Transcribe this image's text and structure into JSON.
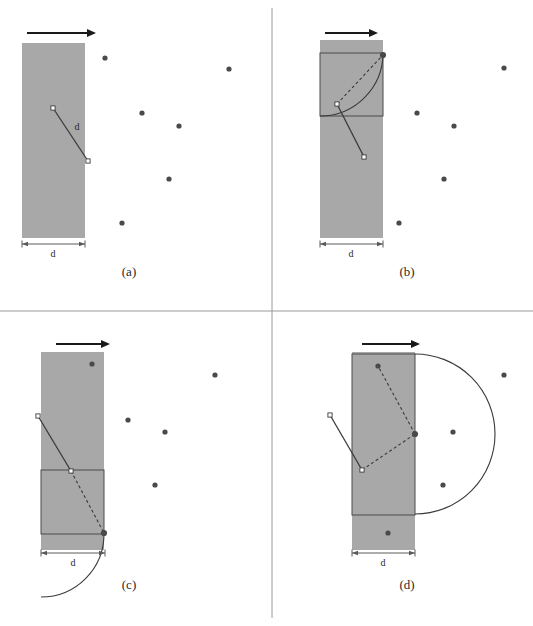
{
  "figure": {
    "width": 533,
    "height": 626,
    "background": "#ffffff",
    "divider_color": "#9a9a9a",
    "strip_fill": "#a8a8a8",
    "strip_stroke": "#6f6f6f",
    "square_stroke": "#4a4a4a",
    "dot_color": "#4a4a4a",
    "arrow_color": "#1a1a1a",
    "line_color": "#3a3a3a",
    "dash_color": "#3a3a3a",
    "open_marker_fill": "#ffffff",
    "dimension_color": "#5a5a5a",
    "dimension_label": "d",
    "segment_label": "d"
  },
  "dividers": {
    "vertical_x": 272,
    "horizontal_y": 311,
    "bottom_rule_y": 310
  },
  "panels": [
    {
      "id": "a",
      "caption": "(a)",
      "caption_x": 129,
      "caption_y": 276,
      "arrow": {
        "x1": 27,
        "y1": 33,
        "x2": 96,
        "y2": 33
      },
      "strip": {
        "x": 22,
        "y": 43,
        "w": 63,
        "h": 195
      },
      "dimension": {
        "x1": 22,
        "x2": 85,
        "y": 244,
        "label": "d",
        "label_x": 53,
        "label_y": 257
      },
      "square": null,
      "arc": null,
      "solid_segment": {
        "x1": 53,
        "y1": 108,
        "x2": 88,
        "y2": 161
      },
      "segment_label": {
        "text": "d",
        "x": 77,
        "y": 130
      },
      "dashed_segment": null,
      "open_markers": [
        {
          "x": 53,
          "y": 108
        },
        {
          "x": 88,
          "y": 161
        }
      ],
      "filled_endpoint": null,
      "dots": [
        {
          "x": 105,
          "y": 58
        },
        {
          "x": 229,
          "y": 69
        },
        {
          "x": 142,
          "y": 113
        },
        {
          "x": 179,
          "y": 126
        },
        {
          "x": 169,
          "y": 179
        },
        {
          "x": 122,
          "y": 223
        }
      ]
    },
    {
      "id": "b",
      "caption": "(b)",
      "caption_x": 407,
      "caption_y": 276,
      "arrow": {
        "x1": 325,
        "y1": 33,
        "x2": 378,
        "y2": 33
      },
      "strip": {
        "x": 320,
        "y": 40,
        "w": 63,
        "h": 198
      },
      "dimension": {
        "x1": 320,
        "x2": 383,
        "y": 244,
        "label": "d",
        "label_x": 351,
        "label_y": 257
      },
      "square": {
        "x": 320,
        "y": 53,
        "w": 63,
        "h": 63
      },
      "arc": {
        "cx": 320,
        "cy": 53,
        "r": 63,
        "start_angle": 0,
        "end_angle": 90
      },
      "solid_segment": {
        "x1": 337,
        "y1": 104,
        "x2": 364,
        "y2": 157
      },
      "segment_label": null,
      "dashed_segment": {
        "x1": 337,
        "y1": 104,
        "x2": 383,
        "y2": 55
      },
      "open_markers": [
        {
          "x": 337,
          "y": 104
        },
        {
          "x": 364,
          "y": 157
        }
      ],
      "filled_endpoint": {
        "x": 383,
        "y": 55
      },
      "dots": [
        {
          "x": 504,
          "y": 68
        },
        {
          "x": 417,
          "y": 113
        },
        {
          "x": 454,
          "y": 126
        },
        {
          "x": 444,
          "y": 179
        },
        {
          "x": 399,
          "y": 223
        }
      ]
    },
    {
      "id": "c",
      "caption": "(c)",
      "caption_x": 129,
      "caption_y": 589,
      "arrow": {
        "x1": 56,
        "y1": 344,
        "x2": 110,
        "y2": 344
      },
      "strip": {
        "x": 41,
        "y": 352,
        "w": 63,
        "h": 198
      },
      "dimension": {
        "x1": 41,
        "x2": 105,
        "y": 553,
        "label": "d",
        "label_x": 73,
        "label_y": 566
      },
      "square": {
        "x": 41,
        "y": 470,
        "w": 63,
        "h": 64
      },
      "arc": {
        "cx": 41,
        "cy": 534,
        "r": 63,
        "start_angle": 0,
        "end_angle": 90
      },
      "solid_segment": {
        "x1": 38,
        "y1": 416,
        "x2": 71,
        "y2": 471
      },
      "segment_label": null,
      "dashed_segment": {
        "x1": 71,
        "y1": 471,
        "x2": 104,
        "y2": 533
      },
      "open_markers": [
        {
          "x": 38,
          "y": 416
        },
        {
          "x": 71,
          "y": 471
        }
      ],
      "filled_endpoint": {
        "x": 104,
        "y": 533
      },
      "dots": [
        {
          "x": 92,
          "y": 364
        },
        {
          "x": 215,
          "y": 375
        },
        {
          "x": 128,
          "y": 420
        },
        {
          "x": 165,
          "y": 432
        },
        {
          "x": 155,
          "y": 485
        }
      ]
    },
    {
      "id": "d",
      "caption": "(d)",
      "caption_x": 407,
      "caption_y": 589,
      "arrow": {
        "x1": 362,
        "y1": 344,
        "x2": 420,
        "y2": 344
      },
      "strip": {
        "x": 352,
        "y": 352,
        "w": 63,
        "h": 198
      },
      "dimension": {
        "x1": 352,
        "x2": 415,
        "y": 553,
        "label": "d",
        "label_x": 383,
        "label_y": 566
      },
      "square": {
        "x": 352,
        "y": 354,
        "w": 63,
        "h": 161
      },
      "arc": {
        "cx": 415,
        "cy": 434,
        "r": 80,
        "start_angle": -90,
        "end_angle": 90
      },
      "solid_segment": {
        "x1": 330,
        "y1": 415,
        "x2": 362,
        "y2": 470
      },
      "segment_label": null,
      "dashed_segment": {
        "x1": 362,
        "y1": 470,
        "x2": 415,
        "y2": 434
      },
      "dashed_segment2": {
        "x1": 415,
        "y1": 434,
        "x2": 378,
        "y2": 366
      },
      "open_markers": [
        {
          "x": 330,
          "y": 415
        },
        {
          "x": 362,
          "y": 470
        }
      ],
      "filled_endpoint": {
        "x": 415,
        "y": 434
      },
      "dots": [
        {
          "x": 504,
          "y": 375
        },
        {
          "x": 378,
          "y": 366
        },
        {
          "x": 453,
          "y": 432
        },
        {
          "x": 443,
          "y": 485
        },
        {
          "x": 388,
          "y": 533
        }
      ]
    }
  ]
}
